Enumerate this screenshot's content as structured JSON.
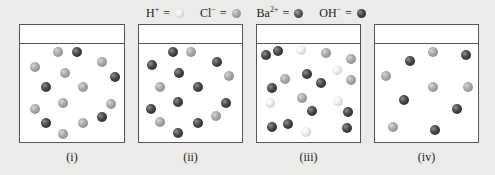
{
  "legend": [
    {
      "symbol": "H",
      "charge": "+",
      "eq": "=",
      "ball": "light",
      "name": "hydrogen-ion"
    },
    {
      "symbol": "Cl",
      "charge": "−",
      "eq": "=",
      "ball": "gray",
      "name": "chloride-ion"
    },
    {
      "symbol": "Ba",
      "charge": "2+",
      "eq": "=",
      "ball": "ba",
      "name": "barium-ion"
    },
    {
      "symbol": "OH",
      "charge": "−",
      "eq": "=",
      "ball": "dark",
      "name": "hydroxide-ion"
    }
  ],
  "colors": {
    "background": "#ebebea",
    "panel_border": "#555555",
    "H+": "#f0f0f0",
    "Cl-": "#9a9a9a",
    "Ba2+": "#4a4a4a",
    "OH-": "#333333"
  },
  "panels": [
    {
      "label": "(i)",
      "left": 19,
      "width": 106,
      "particles": [
        {
          "x": 57.7,
          "y": 51.7,
          "t": "gray"
        },
        {
          "x": 76.7,
          "y": 52.3,
          "t": "dark"
        },
        {
          "x": 35,
          "y": 66.7,
          "t": "gray"
        },
        {
          "x": 101.7,
          "y": 61.7,
          "t": "gray"
        },
        {
          "x": 65,
          "y": 72.7,
          "t": "gray"
        },
        {
          "x": 115,
          "y": 76.7,
          "t": "dark"
        },
        {
          "x": 46,
          "y": 86.7,
          "t": "dark"
        },
        {
          "x": 82.7,
          "y": 86.7,
          "t": "gray"
        },
        {
          "x": 62.7,
          "y": 102.7,
          "t": "gray"
        },
        {
          "x": 111,
          "y": 104,
          "t": "gray"
        },
        {
          "x": 35,
          "y": 109,
          "t": "gray"
        },
        {
          "x": 102.3,
          "y": 116.7,
          "t": "dark"
        },
        {
          "x": 45.7,
          "y": 123.3,
          "t": "dark"
        },
        {
          "x": 82.7,
          "y": 123.3,
          "t": "gray"
        },
        {
          "x": 62.7,
          "y": 134,
          "t": "gray"
        }
      ]
    },
    {
      "label": "(ii)",
      "left": 138,
      "width": 105,
      "particles": [
        {
          "x": 173.3,
          "y": 51.7,
          "t": "dark"
        },
        {
          "x": 191,
          "y": 51.7,
          "t": "gray"
        },
        {
          "x": 151.7,
          "y": 65,
          "t": "dark"
        },
        {
          "x": 216.7,
          "y": 61.7,
          "t": "dark"
        },
        {
          "x": 179.3,
          "y": 73.3,
          "t": "dark"
        },
        {
          "x": 229,
          "y": 76,
          "t": "gray"
        },
        {
          "x": 160,
          "y": 86.7,
          "t": "gray"
        },
        {
          "x": 197.7,
          "y": 86.7,
          "t": "dark"
        },
        {
          "x": 178.3,
          "y": 101.7,
          "t": "dark"
        },
        {
          "x": 225.7,
          "y": 103.3,
          "t": "dark"
        },
        {
          "x": 151,
          "y": 109.3,
          "t": "dark"
        },
        {
          "x": 215.7,
          "y": 116,
          "t": "gray"
        },
        {
          "x": 160,
          "y": 121.7,
          "t": "gray"
        },
        {
          "x": 197.7,
          "y": 122.7,
          "t": "dark"
        },
        {
          "x": 178.3,
          "y": 133.3,
          "t": "dark"
        }
      ]
    },
    {
      "label": "(iii)",
      "left": 256,
      "width": 105,
      "particles": [
        {
          "x": 265.7,
          "y": 55,
          "t": "dark"
        },
        {
          "x": 277.7,
          "y": 50.7,
          "t": "dark"
        },
        {
          "x": 301,
          "y": 50,
          "t": "light"
        },
        {
          "x": 326,
          "y": 52.7,
          "t": "gray"
        },
        {
          "x": 351,
          "y": 59.3,
          "t": "gray"
        },
        {
          "x": 336.7,
          "y": 70,
          "t": "light"
        },
        {
          "x": 285,
          "y": 79.3,
          "t": "gray"
        },
        {
          "x": 306.7,
          "y": 74.3,
          "t": "dark"
        },
        {
          "x": 321,
          "y": 82.7,
          "t": "dark"
        },
        {
          "x": 351,
          "y": 80,
          "t": "gray"
        },
        {
          "x": 271.7,
          "y": 87.7,
          "t": "dark"
        },
        {
          "x": 302.3,
          "y": 97.7,
          "t": "gray"
        },
        {
          "x": 270,
          "y": 103.3,
          "t": "light"
        },
        {
          "x": 338.3,
          "y": 101,
          "t": "light"
        },
        {
          "x": 312.3,
          "y": 110.7,
          "t": "dark"
        },
        {
          "x": 348.3,
          "y": 111.7,
          "t": "dark"
        },
        {
          "x": 271.7,
          "y": 127.3,
          "t": "dark"
        },
        {
          "x": 287.7,
          "y": 124,
          "t": "dark"
        },
        {
          "x": 306,
          "y": 131.7,
          "t": "light"
        },
        {
          "x": 346.7,
          "y": 128.3,
          "t": "dark"
        }
      ]
    },
    {
      "label": "(iv)",
      "left": 374,
      "width": 105,
      "particles": [
        {
          "x": 433.3,
          "y": 51.7,
          "t": "gray"
        },
        {
          "x": 466,
          "y": 55,
          "t": "dark"
        },
        {
          "x": 410,
          "y": 61,
          "t": "dark"
        },
        {
          "x": 386,
          "y": 76,
          "t": "gray"
        },
        {
          "x": 433.3,
          "y": 86.7,
          "t": "gray"
        },
        {
          "x": 467.7,
          "y": 86.7,
          "t": "gray"
        },
        {
          "x": 404,
          "y": 100,
          "t": "dark"
        },
        {
          "x": 457.3,
          "y": 109.3,
          "t": "dark"
        },
        {
          "x": 393.3,
          "y": 126.7,
          "t": "gray"
        },
        {
          "x": 435,
          "y": 130,
          "t": "dark"
        }
      ]
    }
  ]
}
